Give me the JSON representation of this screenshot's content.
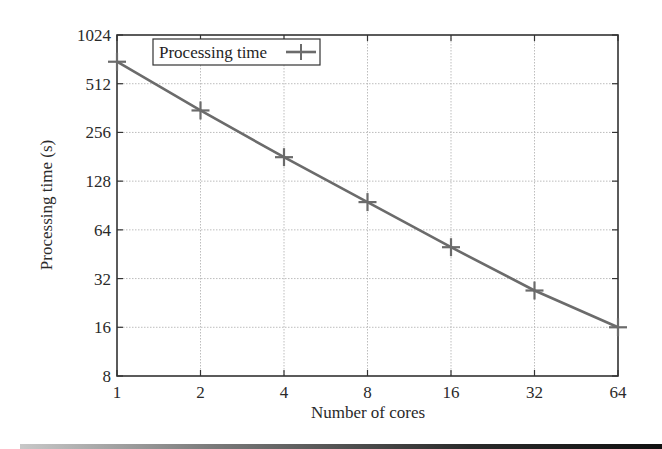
{
  "chart_data": {
    "type": "line",
    "title": "",
    "xlabel": "Number of cores",
    "ylabel": "Processing time (s)",
    "x_scale": "log2",
    "y_scale": "log2",
    "x": [
      1,
      2,
      4,
      8,
      16,
      32,
      64
    ],
    "x_tick_labels": [
      "1",
      "2",
      "4",
      "8",
      "16",
      "32",
      "64"
    ],
    "y_tick_values": [
      8,
      16,
      32,
      64,
      128,
      256,
      512,
      1024
    ],
    "y_tick_labels": [
      "8",
      "16",
      "32",
      "64",
      "128",
      "256",
      "512",
      "1024"
    ],
    "xlim": [
      1,
      64
    ],
    "ylim": [
      8,
      1024
    ],
    "grid": true,
    "legend_position": "top-left (inside)",
    "series": [
      {
        "name": "Processing time",
        "marker": "+",
        "color": "#6b6b6b",
        "values": [
          700,
          350,
          180,
          95,
          50,
          27,
          16
        ]
      }
    ]
  },
  "colors": {
    "line": "#6b6b6b",
    "axis": "#333333",
    "grid": "#bdbdbd",
    "text": "#2a2a2a"
  }
}
